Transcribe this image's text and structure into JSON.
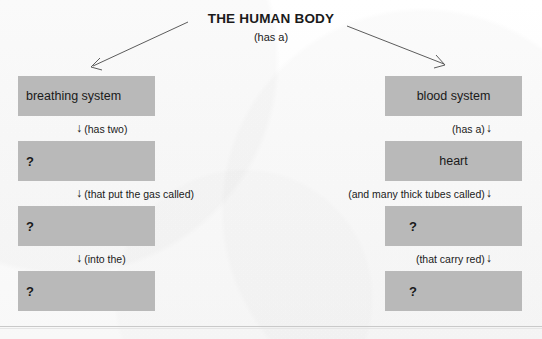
{
  "worksheet": {
    "title": "THE HUMAN BODY",
    "subtitle": "(has a)",
    "box_fill_color": "#b9b9b9",
    "background_color": "#fdfdfd",
    "text_color": "#1a1a1a",
    "rule_color": "#c9c9c9"
  },
  "branch_arrows": {
    "left_arrow_icon": "diagonal-arrow-down-left",
    "right_arrow_icon": "diagonal-arrow-down-right"
  },
  "left_branch": {
    "boxes": [
      {
        "label": "breathing system",
        "align": "left",
        "is_blank": false
      },
      {
        "label": "?",
        "align": "left",
        "is_blank": true
      },
      {
        "label": "?",
        "align": "left",
        "is_blank": true
      },
      {
        "label": "?",
        "align": "left",
        "is_blank": true
      }
    ],
    "connectors": [
      {
        "arrow": "↓",
        "text": "(has two)",
        "arrow_position": "before"
      },
      {
        "arrow": "↓",
        "text": "(that put the gas called)",
        "arrow_position": "before"
      },
      {
        "arrow": "↓",
        "text": "(into the)",
        "arrow_position": "before"
      }
    ]
  },
  "right_branch": {
    "boxes": [
      {
        "label": "blood system",
        "align": "center",
        "is_blank": false
      },
      {
        "label": "heart",
        "align": "center",
        "is_blank": false
      },
      {
        "label": "?",
        "align": "left",
        "is_blank": true
      },
      {
        "label": "?",
        "align": "left",
        "is_blank": true
      }
    ],
    "connectors": [
      {
        "arrow": "↓",
        "text": "(has a)",
        "arrow_position": "after"
      },
      {
        "arrow": "↓",
        "text": "(and many thick tubes called)",
        "arrow_position": "after"
      },
      {
        "arrow": "↓",
        "text": "(that carry red)",
        "arrow_position": "after"
      }
    ]
  }
}
